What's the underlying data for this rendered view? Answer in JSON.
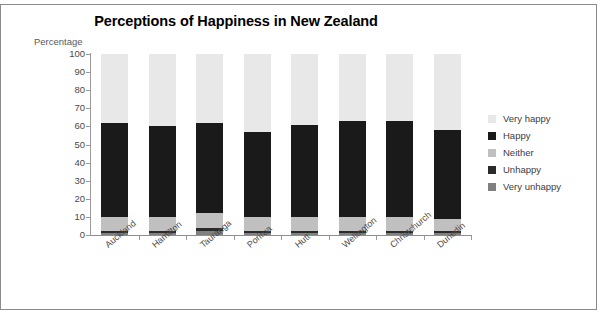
{
  "chart": {
    "title": "Perceptions of Happiness in New Zealand",
    "ylabel": "Percentage"
  },
  "chart_data": {
    "type": "bar",
    "subtype": "stacked-column",
    "title": "Perceptions of Happiness in New Zealand",
    "xlabel": "",
    "ylabel": "Percentage",
    "ylim": [
      0,
      100
    ],
    "yticks": [
      0,
      10,
      20,
      30,
      40,
      50,
      60,
      70,
      80,
      90,
      100
    ],
    "grid": false,
    "legend_position": "right",
    "categories": [
      "Auckland",
      "Hamilton",
      "Tauranga",
      "Porirua",
      "Hutt",
      "Wellington",
      "Christchurch",
      "Dunedin"
    ],
    "series": [
      {
        "name": "Very unhappy",
        "color": "#808080",
        "values": [
          1,
          1,
          2,
          1,
          1,
          1,
          1,
          1
        ]
      },
      {
        "name": "Unhappy",
        "color": "#2b2b2b",
        "values": [
          1,
          1,
          2,
          1,
          1,
          1,
          1,
          1
        ]
      },
      {
        "name": "Neither",
        "color": "#c0c0c0",
        "values": [
          8,
          8,
          8,
          8,
          8,
          8,
          8,
          7
        ]
      },
      {
        "name": "Happy",
        "color": "#1a1a1a",
        "values": [
          52,
          50,
          50,
          47,
          51,
          53,
          53,
          49
        ]
      },
      {
        "name": "Very happy",
        "color": "#e8e8e8",
        "values": [
          38,
          40,
          38,
          43,
          39,
          37,
          37,
          42
        ]
      }
    ]
  },
  "legend": {
    "items": [
      {
        "label": "Very happy",
        "color": "#e8e8e8"
      },
      {
        "label": "Happy",
        "color": "#1a1a1a"
      },
      {
        "label": "Neither",
        "color": "#c0c0c0"
      },
      {
        "label": "Unhappy",
        "color": "#2b2b2b"
      },
      {
        "label": "Very unhappy",
        "color": "#808080"
      }
    ]
  }
}
